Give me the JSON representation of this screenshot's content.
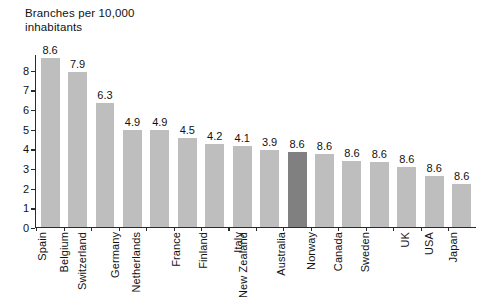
{
  "chart_data": {
    "type": "bar",
    "title_line1": "Branches per 10,000",
    "title_line2": "inhabitants",
    "xlabel": "",
    "ylabel": "",
    "ylim": [
      0,
      8.8
    ],
    "yticks": [
      0,
      1,
      2,
      3,
      4,
      5,
      6,
      7,
      8
    ],
    "ytick_labels": [
      "0",
      "1",
      "2",
      "3",
      "4",
      "5",
      "6",
      "7",
      "8"
    ],
    "grid": false,
    "legend": "none",
    "highlight_category": "Australia",
    "highlight_color": "#808080",
    "bar_color": "#bebebe",
    "axis_color": "#2b2b2b",
    "categories": [
      "Spain",
      "Belgium",
      "Switzerland",
      "Germany",
      "Netherlands",
      "France",
      "Finland",
      "Italy",
      "New Zealand",
      "Australia",
      "Norway",
      "Canada",
      "Sweden",
      "UK",
      "USA",
      "Japan"
    ],
    "values": [
      8.6,
      7.9,
      6.3,
      4.9,
      4.9,
      4.5,
      4.2,
      4.1,
      3.9,
      3.8,
      3.7,
      3.35,
      3.3,
      3.05,
      2.6,
      2.2
    ],
    "data_labels": [
      "8.6",
      "7.9",
      "6.3",
      "4.9",
      "4.9",
      "4.5",
      "4.2",
      "4.1",
      "3.9",
      "8.6",
      "8.6",
      "8.6",
      "8.6",
      "8.6",
      "8.6",
      "8.6"
    ]
  }
}
